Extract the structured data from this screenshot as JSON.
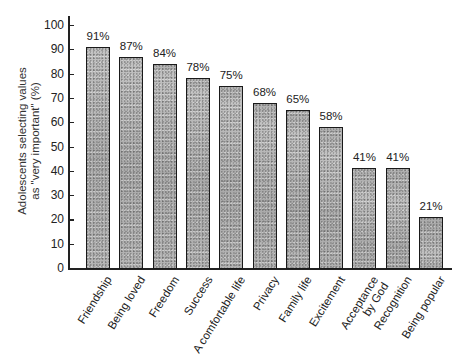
{
  "chart_data": {
    "type": "bar",
    "title": "",
    "xlabel": "",
    "ylabel": "Adolescents selecting values as \"very important\" (%)",
    "ylabel_lines": [
      "Adolescents selecting values",
      "as \"very important\" (%)"
    ],
    "ylim": [
      0,
      100
    ],
    "yticks": [
      0,
      10,
      20,
      30,
      40,
      50,
      60,
      70,
      80,
      90,
      100
    ],
    "grid": false,
    "legend": null,
    "categories": [
      "Friendship",
      "Being loved",
      "Freedom",
      "Success",
      "A comfortable life",
      "Privacy",
      "Family life",
      "Excitement",
      "Acceptance by God",
      "Recognition",
      "Being popular"
    ],
    "category_lines": [
      [
        "Friendship"
      ],
      [
        "Being loved"
      ],
      [
        "Freedom"
      ],
      [
        "Success"
      ],
      [
        "A comfortable life"
      ],
      [
        "Privacy"
      ],
      [
        "Family life"
      ],
      [
        "Excitement"
      ],
      [
        "Acceptance",
        "by God"
      ],
      [
        "Recognition"
      ],
      [
        "Being popular"
      ]
    ],
    "values": [
      91,
      87,
      84,
      78,
      75,
      68,
      65,
      58,
      41,
      41,
      21
    ],
    "value_labels": [
      "91%",
      "87%",
      "84%",
      "78%",
      "75%",
      "68%",
      "65%",
      "58%",
      "41%",
      "41%",
      "21%"
    ]
  }
}
